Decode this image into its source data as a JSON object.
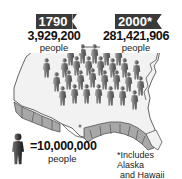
{
  "infographic": {
    "left_label": {
      "year": "1790",
      "count": "3,929,200",
      "unit": "people"
    },
    "right_label": {
      "year": "2000*",
      "count": "281,421,906",
      "unit": "people"
    },
    "legend": {
      "icon": "person-icon",
      "equals_text": "=10,000,000",
      "unit": "people"
    },
    "footnote": {
      "line1": "*Includes Alaska",
      "line2": "and Hawaii"
    },
    "colors": {
      "tag_background": "#3a3a3a",
      "map_fill": "#f2f2f2",
      "map_border": "#555555",
      "border_states_fill": "#a8a8a8",
      "person_icon": "#7a7a7a",
      "legend_icon": "#222222"
    },
    "person_icon_count": 28
  }
}
